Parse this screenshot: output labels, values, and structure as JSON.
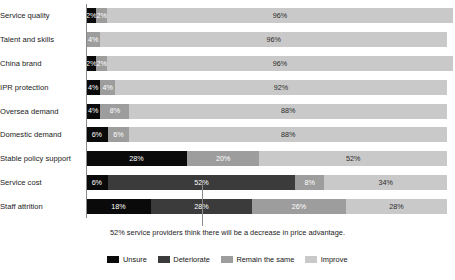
{
  "chart_data": {
    "type": "bar",
    "orientation": "horizontal",
    "stacked": true,
    "normalized_percent": true,
    "title": "",
    "subtitle": "",
    "xlabel": "",
    "ylabel": "",
    "xlim": [
      0,
      100
    ],
    "grid": false,
    "legend_position": "bottom",
    "categories": [
      "Service quality",
      "Talent and skills",
      "China brand",
      "IPR protection",
      "Oversea demand",
      "Domestic demand",
      "Stable policy support",
      "Service cost",
      "Staff attrition"
    ],
    "series": [
      {
        "name": "Unsure",
        "color": "#0a0a0a",
        "values": [
          2,
          0,
          2,
          4,
          4,
          6,
          28,
          6,
          18
        ]
      },
      {
        "name": "Deteriorate",
        "color": "#3b3b3b",
        "values": [
          0,
          0,
          0,
          0,
          0,
          0,
          0,
          52,
          28
        ]
      },
      {
        "name": "Remain the same",
        "color": "#9d9d9d",
        "values": [
          2,
          4,
          2,
          4,
          8,
          6,
          20,
          8,
          26
        ]
      },
      {
        "name": "Improve",
        "color": "#c9c9c9",
        "values": [
          96,
          96,
          96,
          92,
          88,
          88,
          52,
          34,
          28
        ]
      }
    ],
    "rows": [
      {
        "category": "Service quality",
        "segments": [
          {
            "series": "Unsure",
            "value": 2,
            "label": "2%"
          },
          {
            "series": "Remain the same",
            "value": 2,
            "label": "2%"
          },
          {
            "series": "Improve",
            "value": 96,
            "label": "96%"
          }
        ]
      },
      {
        "category": "Talent and skills",
        "segments": [
          {
            "series": "Remain the same",
            "value": 4,
            "label": "4%"
          },
          {
            "series": "Improve",
            "value": 96,
            "label": "96%"
          }
        ]
      },
      {
        "category": "China brand",
        "segments": [
          {
            "series": "Unsure",
            "value": 2,
            "label": "2%"
          },
          {
            "series": "Remain the same",
            "value": 2,
            "label": "2%"
          },
          {
            "series": "Improve",
            "value": 96,
            "label": "96%"
          }
        ]
      },
      {
        "category": "IPR protection",
        "segments": [
          {
            "series": "Unsure",
            "value": 4,
            "label": "4%"
          },
          {
            "series": "Remain the same",
            "value": 4,
            "label": "4%"
          },
          {
            "series": "Improve",
            "value": 92,
            "label": "92%"
          }
        ]
      },
      {
        "category": "Oversea demand",
        "segments": [
          {
            "series": "Unsure",
            "value": 4,
            "label": "4%"
          },
          {
            "series": "Remain the same",
            "value": 8,
            "label": "8%"
          },
          {
            "series": "Improve",
            "value": 88,
            "label": "88%"
          }
        ]
      },
      {
        "category": "Domestic demand",
        "segments": [
          {
            "series": "Unsure",
            "value": 6,
            "label": "6%"
          },
          {
            "series": "Remain the same",
            "value": 6,
            "label": "6%"
          },
          {
            "series": "Improve",
            "value": 88,
            "label": "88%"
          }
        ]
      },
      {
        "category": "Stable policy support",
        "segments": [
          {
            "series": "Unsure",
            "value": 28,
            "label": "28%"
          },
          {
            "series": "Remain the same",
            "value": 20,
            "label": "20%"
          },
          {
            "series": "Improve",
            "value": 52,
            "label": "52%"
          }
        ]
      },
      {
        "category": "Service cost",
        "segments": [
          {
            "series": "Unsure",
            "value": 6,
            "label": "6%"
          },
          {
            "series": "Deteriorate",
            "value": 52,
            "label": "52%"
          },
          {
            "series": "Remain the same",
            "value": 8,
            "label": "8%"
          },
          {
            "series": "Improve",
            "value": 34,
            "label": "34%"
          }
        ]
      },
      {
        "category": "Staff attrition",
        "segments": [
          {
            "series": "Unsure",
            "value": 18,
            "label": "18%"
          },
          {
            "series": "Deteriorate",
            "value": 28,
            "label": "28%"
          },
          {
            "series": "Remain the same",
            "value": 26,
            "label": "26%"
          },
          {
            "series": "Improve",
            "value": 28,
            "label": "28%"
          }
        ]
      }
    ],
    "annotations": [
      {
        "text": "52% service providers think there will be a decrease in price advantage.",
        "points_to_category": "Service cost",
        "points_to_series": "Deteriorate"
      }
    ]
  },
  "legend": {
    "items": [
      {
        "label": "Unsure",
        "color": "#0a0a0a"
      },
      {
        "label": "Deteriorate",
        "color": "#3b3b3b"
      },
      {
        "label": "Remain the same",
        "color": "#9d9d9d"
      },
      {
        "label": "Improve",
        "color": "#c9c9c9"
      }
    ]
  }
}
